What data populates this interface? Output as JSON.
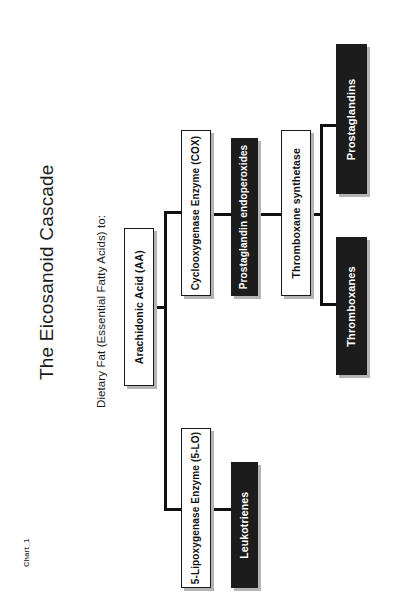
{
  "chart_label": "Chart_1",
  "title": "The Eicosanoid Cascade",
  "subtitle": "Dietary Fat (Essential Fatty Acids) to:",
  "colors": {
    "page_background": "#ffffff",
    "light_node_fill": "#ffffff",
    "light_node_text": "#111111",
    "dark_node_fill": "#1c1c1c",
    "dark_node_text": "#ffffff",
    "border": "#1a1a1a",
    "shadow": "#b4b4b4",
    "connector": "#101010",
    "title_text": "#1a1a1a",
    "chart_label_text": "#4a4a4a"
  },
  "chart_data": {
    "type": "diagram",
    "diagram_kind": "flowchart",
    "orientation": "rotated-90-counterclockwise",
    "title": "The Eicosanoid Cascade",
    "subtitle": "Dietary Fat (Essential Fatty Acids) to:",
    "nodes": [
      {
        "id": "aa",
        "label": "Arachidonic Acid (AA)",
        "style": "light",
        "level": 0
      },
      {
        "id": "cox",
        "label": "Cyclooxygenase Enzyme (COX)",
        "style": "light",
        "level": 1
      },
      {
        "id": "5lo",
        "label": "5-Lipoxygenase Enzyme (5-LO)",
        "style": "light",
        "level": 1
      },
      {
        "id": "pgendo",
        "label": "Prostaglandin endoperoxides",
        "style": "dark",
        "level": 2
      },
      {
        "id": "leuko",
        "label": "Leukotrienes",
        "style": "dark",
        "level": 2
      },
      {
        "id": "txsyn",
        "label": "Thromboxane synthetase",
        "style": "light",
        "level": 3
      },
      {
        "id": "pg",
        "label": "Prostaglandins",
        "style": "dark",
        "level": 4
      },
      {
        "id": "tx",
        "label": "Thromboxanes",
        "style": "dark",
        "level": 4
      }
    ],
    "edges": [
      {
        "from": "aa",
        "to": "cox"
      },
      {
        "from": "aa",
        "to": "5lo"
      },
      {
        "from": "cox",
        "to": "pgendo"
      },
      {
        "from": "5lo",
        "to": "leuko"
      },
      {
        "from": "pgendo",
        "to": "txsyn"
      },
      {
        "from": "txsyn",
        "to": "pg"
      },
      {
        "from": "txsyn",
        "to": "tx"
      }
    ]
  },
  "nodes": {
    "aa": {
      "label": "Arachidonic Acid (AA)"
    },
    "cox": {
      "label": "Cyclooxygenase Enzyme (COX)"
    },
    "lox": {
      "label": "5-Lipoxygenase Enzyme (5-LO)"
    },
    "pgendo": {
      "label": "Prostaglandin endoperoxides"
    },
    "leuko": {
      "label": "Leukotrienes"
    },
    "txsyn": {
      "label": "Thromboxane synthetase"
    },
    "pg": {
      "label": "Prostaglandins"
    },
    "tx": {
      "label": "Thromboxanes"
    }
  }
}
